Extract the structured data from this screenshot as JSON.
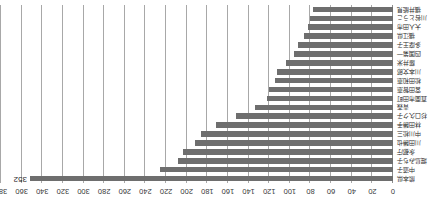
{
  "chart_data": {
    "type": "bar",
    "orientation": "horizontal",
    "title": "",
    "subtitle": "",
    "xlabel": "",
    "ylabel": "",
    "xlim": [
      0,
      380
    ],
    "xtick_step": 20,
    "grid": true,
    "legend": false,
    "bar_color": "#6e6e6e",
    "categories": [
      "熊本県",
      "中道子",
      "堀島みち子",
      "永都庁",
      "川田勝也",
      "中川松三",
      "林田勝手",
      "杉口久ク子",
      "青森",
      "直面市田町",
      "宮田智恵",
      "松田和恵",
      "川本文郎",
      "藤井米",
      "四国第一",
      "多摩王子",
      "福江県",
      "大人田市",
      "川谷とうこ",
      "福井能見"
    ],
    "values": [
      352,
      226,
      208,
      204,
      192,
      186,
      172,
      152,
      134,
      122,
      120,
      114,
      112,
      104,
      96,
      92,
      86,
      82,
      80,
      78
    ],
    "xticks": [
      0,
      20,
      40,
      60,
      80,
      100,
      120,
      140,
      160,
      180,
      200,
      220,
      240,
      260,
      280,
      300,
      320,
      340,
      360,
      380
    ],
    "xtick_labels": [
      "0",
      "20",
      "40",
      "60",
      "80",
      "100",
      "120",
      "140",
      "160",
      "180",
      "200",
      "220",
      "240",
      "260",
      "280",
      "300",
      "320",
      "340",
      "360",
      "380"
    ],
    "annotations": [
      {
        "text": "352",
        "category": "熊本県",
        "value": 352
      }
    ]
  }
}
